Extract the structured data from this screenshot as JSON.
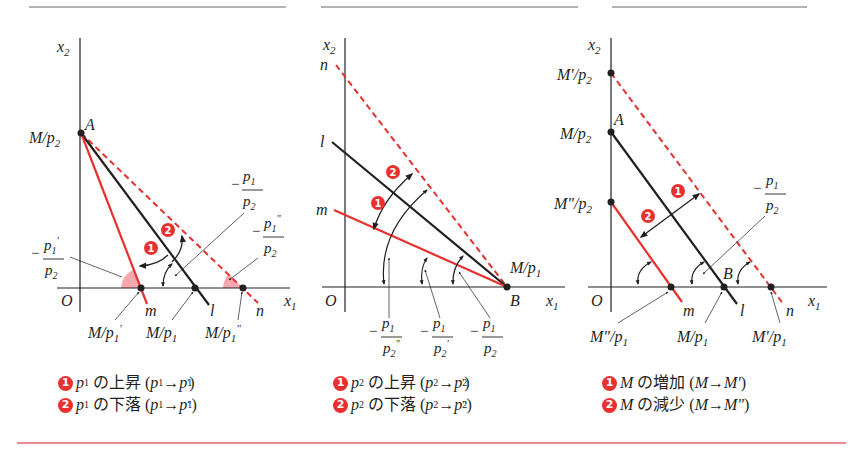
{
  "colors": {
    "red": "#e8312f",
    "black": "#231f20",
    "rule_gray": "#9a9a9a",
    "bottom_rule": "#ea8a92",
    "angle_fill": "#f5a9ae"
  },
  "panels": [
    {
      "id": "p1-change",
      "axis": {
        "y_label": "x2",
        "x_label": "x1",
        "origin": "O"
      },
      "points": {
        "A": "A",
        "intercept_y": "M/p2"
      },
      "lines": {
        "m": "m",
        "l": "l",
        "n": "n"
      },
      "x_intercepts": [
        "M/p1'",
        "M/p1",
        "M/p1\""
      ],
      "slopes": {
        "l": "-p1/p2",
        "m": "-p1'/p2",
        "n": "-p1\"/p2"
      },
      "badges": [
        "1",
        "2"
      ],
      "legend": [
        {
          "badge": "1",
          "var": "p1",
          "text": "の上昇",
          "change": "(p1→p1')"
        },
        {
          "badge": "2",
          "var": "p1",
          "text": "の下落",
          "change": "(p1→p1\")"
        }
      ]
    },
    {
      "id": "p2-change",
      "axis": {
        "y_label": "x2",
        "x_label": "x1",
        "origin": "O"
      },
      "points": {
        "B": "B",
        "intercept_x": "M/p1"
      },
      "lines": {
        "n": "n",
        "l": "l",
        "m": "m"
      },
      "slopes": [
        "-p1/p2\"",
        "-p1/p2'",
        "-p1/p2"
      ],
      "badges": [
        "1",
        "2"
      ],
      "legend": [
        {
          "badge": "1",
          "var": "p2",
          "text": "の上昇",
          "change": "(p2→p2')"
        },
        {
          "badge": "2",
          "var": "p2",
          "text": "の下落",
          "change": "(p2→p2\")"
        }
      ]
    },
    {
      "id": "M-change",
      "axis": {
        "y_label": "x2",
        "x_label": "x1",
        "origin": "O"
      },
      "points": {
        "A": "A",
        "B": "B"
      },
      "y_intercepts": [
        "M'/p2",
        "M/p2",
        "M\"/p2"
      ],
      "x_intercepts": [
        "M\"/p1",
        "M/p1",
        "M'/p1"
      ],
      "lines": {
        "m": "m",
        "l": "l",
        "n": "n"
      },
      "slope": "-p1/p2",
      "badges": [
        "1",
        "2"
      ],
      "legend": [
        {
          "badge": "1",
          "var": "M",
          "text": "の増加",
          "change": "(M→M')"
        },
        {
          "badge": "2",
          "var": "M",
          "text": "の減少",
          "change": "(M→M\")"
        }
      ]
    }
  ]
}
